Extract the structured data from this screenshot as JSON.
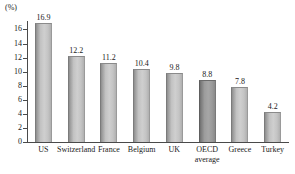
{
  "chart_data": {
    "type": "bar",
    "title": "",
    "subtitle": "",
    "xlabel": "",
    "ylabel": "",
    "unit_label": "(%)",
    "categories": [
      "US",
      "Switzerland",
      "France",
      "Belgium",
      "UK",
      "OECD average",
      "Greece",
      "Turkey"
    ],
    "category_lines": [
      [
        "US"
      ],
      [
        "Switzerland"
      ],
      [
        "France"
      ],
      [
        "Belgium"
      ],
      [
        "UK"
      ],
      [
        "OECD",
        "average"
      ],
      [
        "Greece"
      ],
      [
        "Turkey"
      ]
    ],
    "values": [
      16.9,
      12.2,
      11.2,
      10.4,
      9.8,
      8.8,
      7.8,
      4.2
    ],
    "value_labels": [
      "16.9",
      "12.2",
      "11.2",
      "10.4",
      "9.8",
      "8.8",
      "7.8",
      "4.2"
    ],
    "highlighted": [
      "OECD average"
    ],
    "ylim": [
      0,
      17.2
    ],
    "yticks": [
      0,
      2,
      4,
      6,
      8,
      10,
      12,
      14,
      16
    ],
    "ytick_labels": [
      "0",
      "2",
      "4",
      "6",
      "8",
      "10",
      "12",
      "14",
      "16"
    ],
    "grid": false,
    "legend": null,
    "colors": {
      "bar_fill": "#c6c6c6",
      "bar_fill_highlight": "#9c9c9c",
      "axis": "#4a4a4a",
      "text": "#1a1a1a",
      "background": "#ffffff"
    }
  }
}
